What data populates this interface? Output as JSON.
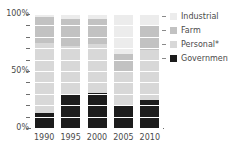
{
  "chart_data": {
    "type": "bar",
    "stacked": true,
    "title": "",
    "xlabel": "",
    "ylabel": "",
    "categories": [
      "1990",
      "1995",
      "2000",
      "2005",
      "2010"
    ],
    "ylim": [
      0,
      100
    ],
    "ytick_labels": [
      "0%",
      "50%",
      "100%"
    ],
    "ytick_values": [
      0,
      50,
      100
    ],
    "grid": true,
    "legend_position": "right",
    "value_unit": "%",
    "series": [
      {
        "name": "Government",
        "color": "#1c1c1c",
        "values": [
          13,
          29,
          31,
          20,
          25
        ]
      },
      {
        "name": "Personal*",
        "color": "#d8d8d8",
        "values": [
          62,
          43,
          43,
          30,
          43
        ]
      },
      {
        "name": "Farm",
        "color": "#c2c2c2",
        "values": [
          22,
          24,
          22,
          15,
          22
        ]
      },
      {
        "name": "Industrial",
        "color": "#ececec",
        "values": [
          3,
          4,
          4,
          35,
          10
        ]
      }
    ],
    "stack_order": [
      "Government",
      "Personal*",
      "Farm",
      "Industrial"
    ]
  },
  "legend": {
    "items": [
      {
        "label": "Industrial",
        "color": "#ececec"
      },
      {
        "label": "Farm",
        "color": "#c2c2c2"
      },
      {
        "label": "Personal*",
        "color": "#d8d8d8"
      },
      {
        "label": "Government",
        "color": "#1c1c1c"
      }
    ]
  },
  "axis": {
    "y_labels": [
      "100%",
      "50%",
      "0%"
    ],
    "x_labels": [
      "1990",
      "1995",
      "2000",
      "2005",
      "2010"
    ]
  },
  "colors": {
    "background": "#ffffff",
    "text": "#4a4a4a",
    "axis": "#6e6e6e",
    "gridline": "#ffffff"
  }
}
